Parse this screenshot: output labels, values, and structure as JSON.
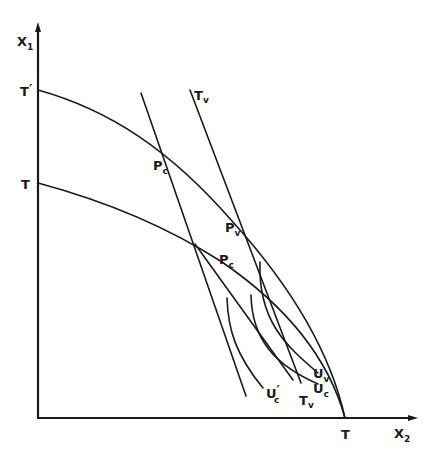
{
  "figure": {
    "type": "economics-diagram",
    "axes": {
      "y_label": {
        "main": "X",
        "sub": "1"
      },
      "x_label": {
        "main": "X",
        "sub": "2"
      }
    },
    "intercepts": {
      "outer_ppf_y": {
        "main": "T",
        "prime": "′"
      },
      "inner_ppf_y": {
        "main": "T"
      },
      "ppf_x": {
        "main": "T"
      }
    },
    "points": {
      "p_c_prime": {
        "main": "P",
        "sub": "c",
        "prime": "′"
      },
      "p_v": {
        "main": "P",
        "sub": "v"
      },
      "p_c": {
        "main": "P",
        "sub": "c"
      }
    },
    "lines": {
      "t_v_top": {
        "main": "T",
        "sub": "v"
      },
      "t_v_bottom": {
        "main": "T",
        "sub": "v"
      }
    },
    "indifference_curves": {
      "u_c_prime": {
        "main": "U",
        "sub": "c",
        "prime": "′"
      },
      "u_c": {
        "main": "U",
        "sub": "c"
      },
      "u_v": {
        "main": "U",
        "sub": "v"
      }
    },
    "colors": {
      "ink": "#1a1a1a",
      "background": "#ffffff"
    }
  }
}
